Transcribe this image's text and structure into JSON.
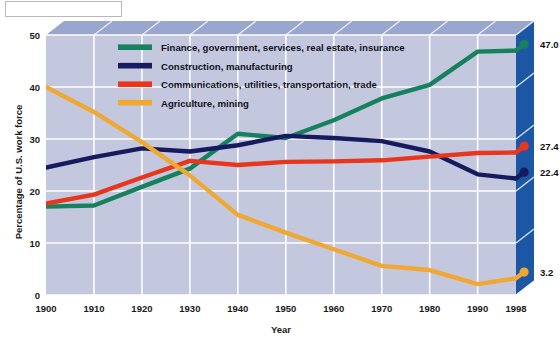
{
  "figure": {
    "background_color": "#ffffff",
    "plot_background_color": "#c3c8de",
    "plot_top_face_color": "#9aa6cd",
    "plot_right_face_color": "#1b57a5",
    "gridline_color": "#ffffff",
    "corner_box": {
      "label": ""
    }
  },
  "chart_data": {
    "type": "line",
    "title": "",
    "xlabel": "Year",
    "ylabel": "Percentage of U.S. work force",
    "xlim": [
      1900,
      1998
    ],
    "ylim": [
      0,
      50
    ],
    "grid": true,
    "legend_position": "inside-top-center",
    "x_tick_labels": [
      "1900",
      "1910",
      "1920",
      "1930",
      "1940",
      "1950",
      "1960",
      "1970",
      "1980",
      "1990",
      "1998"
    ],
    "y_tick_labels": [
      "0",
      "10",
      "20",
      "30",
      "40",
      "50"
    ],
    "y_ticks": [
      0,
      10,
      20,
      30,
      40,
      50
    ],
    "x": [
      1900,
      1910,
      1920,
      1930,
      1940,
      1950,
      1960,
      1970,
      1980,
      1990,
      1998
    ],
    "series": [
      {
        "name": "Finance, government, services, real estate, insurance",
        "color": "#17805e",
        "values": [
          17.0,
          17.2,
          20.8,
          24.3,
          31.0,
          30.2,
          33.6,
          37.8,
          40.4,
          46.8,
          47.0
        ],
        "end_label": "47.0"
      },
      {
        "name": "Construction, manufacturing",
        "color": "#161a5e",
        "values": [
          24.5,
          26.5,
          28.2,
          27.6,
          28.8,
          30.6,
          30.2,
          29.6,
          27.6,
          23.2,
          22.4
        ],
        "end_label": "22.4"
      },
      {
        "name": "Communications, utilities, transportation, trade",
        "color": "#e8361c",
        "values": [
          17.6,
          19.3,
          22.6,
          25.8,
          25.0,
          25.6,
          25.7,
          25.9,
          26.6,
          27.3,
          27.4
        ],
        "end_label": "27.4"
      },
      {
        "name": "Agriculture, mining",
        "color": "#f0a832",
        "values": [
          40.0,
          35.2,
          29.4,
          23.0,
          15.4,
          12.0,
          8.8,
          5.6,
          4.8,
          2.1,
          3.2
        ],
        "end_label": "3.2"
      }
    ]
  },
  "legend": {
    "items": [
      {
        "label": "Finance, government, services, real estate, insurance",
        "color": "#17805e"
      },
      {
        "label": "Construction, manufacturing",
        "color": "#161a5e"
      },
      {
        "label": "Communications, utilities, transportation, trade",
        "color": "#e8361c"
      },
      {
        "label": "Agriculture, mining",
        "color": "#f0a832"
      }
    ]
  }
}
